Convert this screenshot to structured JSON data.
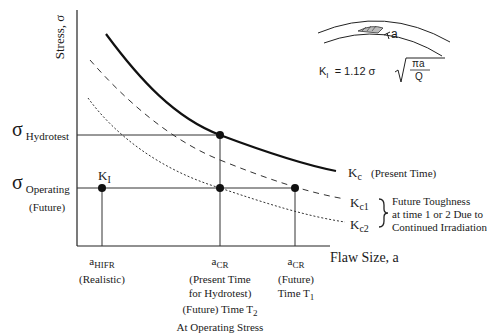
{
  "diagram": {
    "y_axis_label": "Stress, σ",
    "x_axis_label": "Flaw Size, a",
    "stress_levels": {
      "hydrotest": {
        "symbol": "σ",
        "subscript": "Hydrotest"
      },
      "operating": {
        "symbol": "σ",
        "subscript": "Operating",
        "note": "(Future)"
      }
    },
    "point_label_KI": {
      "main": "K",
      "sub": "I"
    },
    "curves": {
      "kc": {
        "main": "K",
        "sub": "c",
        "note": "(Present Time)",
        "style": "solid"
      },
      "kc1": {
        "main": "K",
        "sub": "c1",
        "style": "dashed"
      },
      "kc2": {
        "main": "K",
        "sub": "c2",
        "style": "dotted"
      },
      "future_note": [
        "Future Toughness",
        "at time 1 or 2 Due to",
        "Continued Irradiation"
      ]
    },
    "x_ticks": [
      {
        "main": "a",
        "sub": "HIFR",
        "lines": [
          "(Realistic)"
        ]
      },
      {
        "main": "a",
        "sub": "CR",
        "lines": [
          "(Present Time",
          "for Hydrotest)"
        ],
        "extra_main": "(Future) Time T",
        "extra_sub": "2",
        "extra_line": "At Operating Stress"
      },
      {
        "main": "a",
        "sub": "CR",
        "lines": [
          "(Future)"
        ],
        "time_main": "Time T",
        "time_sub": "1"
      }
    ],
    "inset": {
      "flaw_label": "a",
      "formula_lhs_main": "K",
      "formula_lhs_sub": "I",
      "formula_rhs": "= 1.12 σ",
      "sqrt_numerator": "πa",
      "sqrt_denominator": "Q"
    }
  }
}
